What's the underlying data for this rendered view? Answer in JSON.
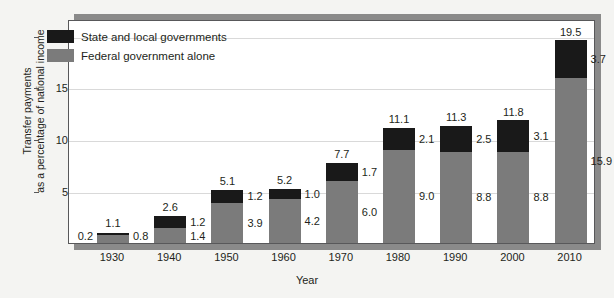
{
  "chart_data": {
    "type": "bar",
    "stacked": true,
    "title": "",
    "xlabel": "Year",
    "ylabel": "Transfer payments as a percentage of national income",
    "ylabel_line1": "Transfer payments",
    "ylabel_line2": "as a percentage of national income",
    "categories": [
      "1930",
      "1940",
      "1950",
      "1960",
      "1970",
      "1980",
      "1990",
      "2000",
      "2010"
    ],
    "series": [
      {
        "name": "Federal government alone",
        "color": "#7b7b7b",
        "values": [
          0.8,
          1.4,
          3.9,
          4.2,
          6.0,
          9.0,
          8.8,
          8.8,
          15.9
        ]
      },
      {
        "name": "State and local governments",
        "color": "#191919",
        "values": [
          0.2,
          1.2,
          1.2,
          1.0,
          1.7,
          2.1,
          2.5,
          3.1,
          3.7
        ]
      }
    ],
    "totals": [
      1.1,
      2.6,
      5.1,
      5.2,
      7.7,
      11.1,
      11.3,
      11.8,
      19.5
    ],
    "yticks": [
      5,
      10,
      15,
      20
    ],
    "ytick_labels": [
      "5",
      "10",
      "15",
      "20"
    ],
    "ylim": [
      0,
      21.6
    ],
    "grid": true,
    "legend_position": "upper-left",
    "legend": [
      {
        "label": "State and local governments",
        "color": "#191919"
      },
      {
        "label": "Federal government alone",
        "color": "#7b7b7b"
      }
    ]
  },
  "colors": {
    "background": "#f4f4f2",
    "plot_background": "#ffffff",
    "frame": "#58585a",
    "shadow": "#8a8a8a",
    "gridline": "#d9d9d9",
    "text": "#231f20",
    "state_local": "#191919",
    "federal": "#7b7b7b"
  }
}
